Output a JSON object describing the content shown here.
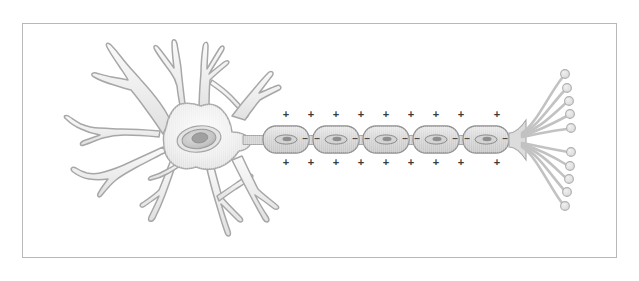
{
  "figure": {
    "background_color": "#ffffff",
    "frame": {
      "name": "image-border",
      "x": 22,
      "y": 23,
      "width": 595,
      "height": 235,
      "stroke_color": "#b8b8b8",
      "fill_color": "#ffffff"
    }
  },
  "palette": {
    "membrane_stroke": "#a7a7a7",
    "cell_fill_light": "#f4f4f4",
    "cell_fill_mid": "#e6e6e6",
    "myelin_fill": "#d8d8d8",
    "myelin_stroke": "#9a9a9a",
    "nucleus_fill": "#c9c9c9",
    "nucleus_stroke": "#8f8f8f",
    "nucleolus_fill": "#9e9e9e",
    "terminal_fill": "#e2e2e2",
    "terminal_stroke": "#b0b0b0",
    "charge_text": "#3a3a3a"
  },
  "soma": {
    "name": "cell-body",
    "center_x": 196,
    "center_y": 140,
    "nucleus": {
      "name": "nucleus",
      "cx": 199,
      "cy": 139,
      "rx": 22,
      "ry": 13,
      "rotation": -8,
      "nucleolus": {
        "cx": 200,
        "cy": 138,
        "rx": 8,
        "ry": 5
      }
    }
  },
  "dendrites": {
    "name": "dendrite-group",
    "count": 8,
    "description": "Branching tapered processes radiating from the cell body"
  },
  "axon": {
    "name": "axon",
    "start_x": 240,
    "end_x": 520,
    "center_y": 140,
    "thickness": 7
  },
  "myelin_segments": [
    {
      "name": "myelin-sheath-1",
      "cx": 286,
      "cy": 139,
      "rx": 23,
      "ry": 12,
      "left_minus": false,
      "right_minus": true
    },
    {
      "name": "myelin-sheath-2",
      "cx": 336,
      "cy": 139,
      "rx": 23,
      "ry": 12,
      "left_minus": true,
      "right_minus": true
    },
    {
      "name": "myelin-sheath-3",
      "cx": 386,
      "cy": 139,
      "rx": 23,
      "ry": 12,
      "left_minus": true,
      "right_minus": true
    },
    {
      "name": "myelin-sheath-4",
      "cx": 436,
      "cy": 139,
      "rx": 23,
      "ry": 12,
      "left_minus": true,
      "right_minus": true
    },
    {
      "name": "myelin-sheath-5",
      "cx": 486,
      "cy": 139,
      "rx": 23,
      "ry": 12,
      "left_minus": true,
      "right_minus": true
    }
  ],
  "charges": {
    "outer_symbol": "+",
    "node_symbol": "–",
    "top_row_y": 115,
    "bottom_row_y": 163,
    "x_positions": [
      286,
      311,
      336,
      361,
      386,
      411,
      436,
      461,
      497
    ],
    "node_minus_y": 139,
    "node_minus_x_positions": [
      311,
      361,
      411,
      461,
      507
    ]
  },
  "axon_terminals": {
    "name": "axon-terminal-group",
    "origin_x": 519,
    "origin_y": 140,
    "branch_count": 10,
    "bouton_radius": 4.2,
    "boutons": [
      {
        "cx": 568,
        "cy": 74
      },
      {
        "cx": 570,
        "cy": 88
      },
      {
        "cx": 571,
        "cy": 101
      },
      {
        "cx": 572,
        "cy": 115
      },
      {
        "cx": 573,
        "cy": 128
      },
      {
        "cx": 573,
        "cy": 152
      },
      {
        "cx": 572,
        "cy": 166
      },
      {
        "cx": 571,
        "cy": 180
      },
      {
        "cx": 570,
        "cy": 193
      },
      {
        "cx": 568,
        "cy": 207
      }
    ]
  }
}
